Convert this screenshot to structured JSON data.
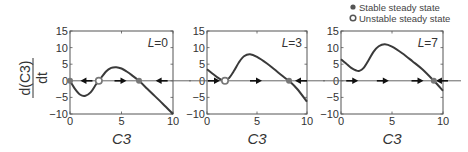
{
  "chart_data": [
    {
      "type": "line",
      "panel_label": "L=0",
      "xlabel": "C3",
      "ylabel": "d(C3)/dt",
      "xlim": [
        0,
        10
      ],
      "ylim": [
        -10,
        15
      ],
      "xticks": [
        0,
        5,
        10
      ],
      "yticks": [
        15,
        10,
        5,
        0,
        -5,
        -10
      ],
      "x": [
        0,
        0.5,
        1,
        1.5,
        2,
        2.5,
        2.8,
        3.5,
        4,
        4.5,
        5,
        5.5,
        6,
        6.7,
        7.5,
        8,
        9,
        10
      ],
      "y": [
        0,
        -2.5,
        -4.2,
        -4.5,
        -3.5,
        -1.2,
        0,
        2.8,
        3.9,
        4.1,
        3.7,
        2.8,
        1.7,
        0,
        -2.4,
        -3.9,
        -6.9,
        -10
      ],
      "stable_points": [
        0,
        6.7
      ],
      "unstable_points": [
        2.8
      ],
      "arrows": [
        {
          "x": 1.5,
          "dir": "left"
        },
        {
          "x": 5,
          "dir": "right"
        },
        {
          "x": 8.8,
          "dir": "left"
        }
      ]
    },
    {
      "type": "line",
      "panel_label": "L=3",
      "xlabel": "C3",
      "xlim": [
        0,
        10
      ],
      "ylim": [
        -10,
        15
      ],
      "xticks": [
        0,
        5,
        10
      ],
      "yticks": [
        15,
        10,
        5,
        0,
        -5,
        -10
      ],
      "x": [
        0,
        0.5,
        1,
        1.5,
        1.8,
        2.2,
        2.7,
        3.2,
        3.7,
        4.3,
        5,
        6,
        7,
        8,
        8.2,
        9,
        10
      ],
      "y": [
        3.5,
        2.3,
        1.1,
        0.2,
        0,
        0.8,
        3,
        5.6,
        7.4,
        8,
        7.2,
        5.2,
        2.8,
        0.4,
        0,
        -2.4,
        -6.3
      ],
      "stable_points": [
        8.2
      ],
      "unstable_points": [
        1.8
      ],
      "arrows": [
        {
          "x": 0.8,
          "dir": "right"
        },
        {
          "x": 5,
          "dir": "right"
        },
        {
          "x": 9.3,
          "dir": "left"
        }
      ]
    },
    {
      "type": "line",
      "panel_label": "L=7",
      "xlabel": "C3",
      "xlim": [
        0,
        10
      ],
      "ylim": [
        -10,
        15
      ],
      "xticks": [
        0,
        5,
        10
      ],
      "yticks": [
        15,
        10,
        5,
        0,
        -5,
        -10
      ],
      "x": [
        0,
        0.5,
        1,
        1.5,
        1.8,
        2.2,
        2.7,
        3.2,
        3.7,
        4.3,
        5,
        6,
        7,
        8,
        9.1,
        10
      ],
      "y": [
        6.5,
        5.2,
        3.9,
        3.1,
        3,
        3.8,
        6.2,
        8.8,
        10.4,
        11,
        10.3,
        8.3,
        5.9,
        3.4,
        0,
        -3
      ],
      "stable_points": [
        9.1
      ],
      "unstable_points": [],
      "arrows": [
        {
          "x": 1.2,
          "dir": "right"
        },
        {
          "x": 4.2,
          "dir": "right"
        },
        {
          "x": 7.6,
          "dir": "right"
        },
        {
          "x": 9.8,
          "dir": "left"
        }
      ]
    }
  ],
  "legend": {
    "stable_label": "Stable steady state",
    "unstable_label": "Unstable steady state"
  },
  "axis": {
    "ylabel_numerator": "d(C3)",
    "ylabel_denominator": "dt",
    "xlabel": "C3"
  },
  "colors": {
    "curve": "#3a3a3a",
    "axis": "#555555",
    "marker": "#777777"
  }
}
